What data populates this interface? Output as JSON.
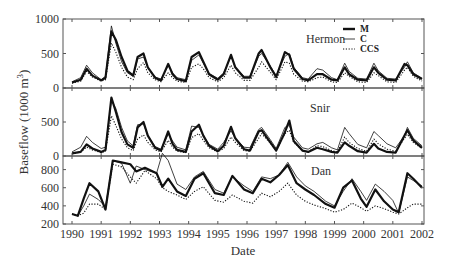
{
  "chart_data": {
    "type": "line",
    "title": "",
    "xlabel": "Date",
    "ylabel": "Baseflow (1000 m³)",
    "ylabel_main": "Baseflow (1000 m",
    "ylabel_sup": "3",
    "ylabel_close": ")",
    "x_ticks": [
      "1990",
      "1991",
      "1992",
      "1993",
      "1994",
      "1995",
      "1996",
      "1997",
      "1998",
      "1999",
      "2000",
      "2001",
      "2002"
    ],
    "xlim": [
      1990,
      2002
    ],
    "legend": {
      "position": "top-right of top panel",
      "entries": [
        {
          "label": "M",
          "style": "thick solid"
        },
        {
          "label": "C",
          "style": "thin solid"
        },
        {
          "label": "CCS",
          "style": "dotted"
        }
      ]
    },
    "panels": [
      {
        "name": "Hermon",
        "ylim": [
          0,
          1000
        ],
        "y_ticks": [
          "0",
          "500",
          "1000"
        ],
        "x": [
          1990.0,
          1990.3,
          1990.5,
          1990.7,
          1991.0,
          1991.15,
          1991.35,
          1991.5,
          1991.7,
          1991.9,
          1992.1,
          1992.25,
          1992.45,
          1992.6,
          1992.85,
          1993.05,
          1993.3,
          1993.45,
          1993.6,
          1993.9,
          1994.1,
          1994.35,
          1994.5,
          1994.7,
          1995.0,
          1995.2,
          1995.45,
          1995.6,
          1995.9,
          1996.1,
          1996.4,
          1996.5,
          1996.8,
          1997.0,
          1997.3,
          1997.45,
          1997.6,
          1997.9,
          1998.1,
          1998.4,
          1998.6,
          1998.9,
          1999.1,
          1999.35,
          1999.5,
          1999.8,
          2000.1,
          2000.35,
          2000.5,
          2000.8,
          2001.1,
          2001.4,
          2001.5,
          2001.7,
          2002.0
        ],
        "series": [
          {
            "name": "M",
            "values": [
              80,
              120,
              280,
              180,
              110,
              150,
              820,
              700,
              450,
              250,
              180,
              450,
              500,
              300,
              150,
              110,
              350,
              200,
              130,
              100,
              450,
              520,
              380,
              200,
              120,
              200,
              480,
              300,
              150,
              150,
              500,
              550,
              300,
              160,
              520,
              480,
              280,
              130,
              110,
              200,
              200,
              120,
              110,
              300,
              200,
              120,
              110,
              300,
              220,
              120,
              110,
              350,
              330,
              200,
              130
            ]
          },
          {
            "name": "C",
            "values": [
              90,
              150,
              330,
              220,
              120,
              170,
              900,
              650,
              380,
              220,
              170,
              420,
              450,
              300,
              160,
              130,
              320,
              220,
              150,
              120,
              400,
              480,
              360,
              210,
              140,
              220,
              460,
              300,
              170,
              170,
              460,
              500,
              320,
              180,
              460,
              500,
              300,
              150,
              130,
              280,
              260,
              150,
              120,
              360,
              240,
              140,
              130,
              360,
              250,
              140,
              130,
              300,
              380,
              220,
              140
            ]
          },
          {
            "name": "CCS",
            "values": [
              70,
              100,
              240,
              160,
              100,
              120,
              650,
              520,
              300,
              160,
              120,
              280,
              370,
              220,
              120,
              90,
              220,
              150,
              100,
              80,
              300,
              350,
              280,
              150,
              90,
              150,
              330,
              220,
              110,
              110,
              300,
              380,
              230,
              120,
              380,
              360,
              200,
              100,
              90,
              150,
              160,
              90,
              80,
              220,
              170,
              90,
              80,
              220,
              180,
              90,
              80,
              260,
              300,
              170,
              100
            ]
          }
        ]
      },
      {
        "name": "Snir",
        "ylim": [
          0,
          1000
        ],
        "y_ticks": [
          "0",
          "500"
        ],
        "x": [
          1990.0,
          1990.3,
          1990.5,
          1990.7,
          1991.0,
          1991.15,
          1991.35,
          1991.5,
          1991.7,
          1991.9,
          1992.1,
          1992.25,
          1992.45,
          1992.6,
          1992.85,
          1993.05,
          1993.3,
          1993.45,
          1993.6,
          1993.9,
          1994.1,
          1994.35,
          1994.5,
          1994.7,
          1995.0,
          1995.2,
          1995.45,
          1995.6,
          1995.9,
          1996.1,
          1996.4,
          1996.5,
          1996.8,
          1997.0,
          1997.3,
          1997.45,
          1997.6,
          1997.9,
          1998.1,
          1998.4,
          1998.6,
          1998.9,
          1999.1,
          1999.35,
          1999.5,
          1999.8,
          2000.1,
          2000.35,
          2000.5,
          2000.8,
          2001.1,
          2001.4,
          2001.5,
          2001.7,
          2002.0
        ],
        "series": [
          {
            "name": "M",
            "values": [
              40,
              60,
              170,
              110,
              60,
              90,
              860,
              650,
              350,
              170,
              120,
              420,
              500,
              300,
              120,
              80,
              360,
              180,
              90,
              60,
              360,
              460,
              300,
              150,
              70,
              150,
              430,
              260,
              100,
              80,
              360,
              380,
              200,
              80,
              350,
              520,
              220,
              80,
              60,
              120,
              100,
              60,
              50,
              200,
              150,
              70,
              50,
              180,
              110,
              60,
              50,
              300,
              380,
              230,
              120
            ]
          },
          {
            "name": "C",
            "values": [
              60,
              130,
              290,
              200,
              110,
              130,
              820,
              700,
              420,
              220,
              150,
              460,
              470,
              300,
              140,
              100,
              320,
              220,
              130,
              90,
              440,
              420,
              300,
              170,
              100,
              200,
              370,
              260,
              130,
              120,
              390,
              420,
              240,
              110,
              420,
              450,
              280,
              120,
              100,
              180,
              200,
              120,
              90,
              420,
              330,
              170,
              120,
              360,
              300,
              180,
              120,
              300,
              420,
              260,
              150
            ]
          },
          {
            "name": "CCS",
            "values": [
              30,
              60,
              130,
              90,
              50,
              70,
              590,
              450,
              250,
              120,
              80,
              250,
              310,
              200,
              90,
              60,
              230,
              130,
              70,
              50,
              270,
              330,
              230,
              120,
              60,
              110,
              280,
              200,
              80,
              70,
              260,
              330,
              190,
              80,
              330,
              380,
              200,
              80,
              60,
              150,
              140,
              80,
              60,
              280,
              200,
              110,
              70,
              250,
              180,
              100,
              70,
              260,
              320,
              200,
              110
            ]
          }
        ]
      },
      {
        "name": "Dan",
        "ylim": [
          200,
          950
        ],
        "y_ticks": [
          "200",
          "400",
          "600",
          "800"
        ],
        "x": [
          1990.0,
          1990.2,
          1990.4,
          1990.6,
          1990.9,
          1991.15,
          1991.4,
          1991.7,
          1992.0,
          1992.2,
          1992.5,
          1992.9,
          1993.1,
          1993.3,
          1993.6,
          1993.9,
          1994.2,
          1994.5,
          1994.9,
          1995.2,
          1995.5,
          1995.9,
          1996.2,
          1996.5,
          1996.8,
          1997.1,
          1997.4,
          1997.7,
          1998.0,
          1998.3,
          1998.7,
          1999.0,
          1999.3,
          1999.6,
          1999.9,
          2000.1,
          2000.4,
          2000.7,
          2001.0,
          2001.2,
          2001.5,
          2001.7,
          2002.0
        ],
        "series": [
          {
            "name": "M",
            "values": [
              310,
              290,
              480,
              650,
              560,
              360,
              900,
              880,
              860,
              780,
              820,
              760,
              610,
              700,
              560,
              510,
              700,
              760,
              540,
              520,
              730,
              580,
              540,
              700,
              660,
              740,
              850,
              650,
              580,
              520,
              420,
              380,
              600,
              680,
              480,
              390,
              580,
              450,
              360,
              330,
              760,
              700,
              600
            ]
          },
          {
            "name": "C",
            "values": [
              310,
              290,
              400,
              530,
              470,
              390,
              900,
              870,
              650,
              840,
              800,
              760,
              980,
              900,
              640,
              580,
              720,
              780,
              580,
              540,
              720,
              620,
              560,
              720,
              700,
              740,
              880,
              720,
              620,
              560,
              450,
              400,
              560,
              700,
              560,
              460,
              640,
              560,
              460,
              320,
              720,
              680,
              620
            ]
          },
          {
            "name": "CCS",
            "values": [
              310,
              290,
              320,
              420,
              420,
              360,
              860,
              830,
              720,
              650,
              790,
              700,
              600,
              560,
              520,
              470,
              560,
              610,
              460,
              440,
              520,
              450,
              430,
              540,
              500,
              560,
              650,
              520,
              450,
              410,
              370,
              330,
              360,
              430,
              380,
              340,
              400,
              370,
              330,
              310,
              380,
              420,
              420
            ]
          }
        ]
      }
    ],
    "grid": false
  }
}
